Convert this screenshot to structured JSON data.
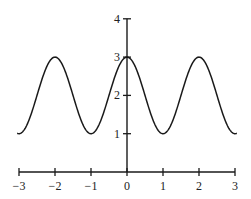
{
  "chart_data": {
    "type": "line",
    "title": "",
    "xlabel": "",
    "ylabel": "",
    "function": "y = 2 + cos(pi * x)",
    "xlim": [
      -3.05,
      3.05
    ],
    "ylim": [
      0,
      4
    ],
    "grid": false,
    "legend": null,
    "x_ticks": [
      -3,
      -2,
      -1,
      0,
      1,
      2,
      3
    ],
    "x_tick_labels": [
      "−3",
      "−2",
      "−1",
      "0",
      "1",
      "2",
      "3"
    ],
    "y_ticks": [
      1,
      2,
      3,
      4
    ],
    "y_tick_labels": [
      "1",
      "2",
      "3",
      "4"
    ],
    "series": [
      {
        "name": "curve",
        "x": [
          -3.05,
          -3,
          -2.5,
          -2,
          -1.5,
          -1,
          -0.5,
          0,
          0.5,
          1,
          1.5,
          2,
          2.5,
          3,
          3.05
        ],
        "values": [
          1.01,
          1,
          2,
          3,
          2,
          1,
          2,
          3,
          2,
          1,
          2,
          3,
          2,
          1,
          1.01
        ]
      }
    ],
    "colors": {
      "curve": "#1a1a1a",
      "axes": "#1a1a1a"
    }
  }
}
